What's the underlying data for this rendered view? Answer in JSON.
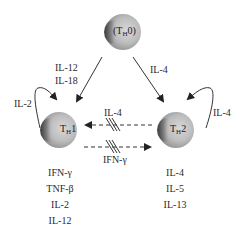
{
  "cells": {
    "th0": {
      "main": "T",
      "sub": "H",
      "suffix": "0"
    },
    "th1": {
      "main": "T",
      "sub": "H",
      "suffix": "1"
    },
    "th2": {
      "main": "T",
      "sub": "H",
      "suffix": "2"
    }
  },
  "arrows": {
    "th0_to_th1": {
      "line1": "IL-12",
      "line2": "IL-18"
    },
    "th0_to_th2": {
      "label": "IL-4"
    },
    "th1_self": {
      "label": "IL-2"
    },
    "th2_self": {
      "label": "IL-4"
    },
    "th2_to_th1_inhibit": {
      "label": "IL-4"
    },
    "th1_to_th2_inhibit": {
      "label": "IFN-γ"
    }
  },
  "th1_products": [
    "IFN-γ",
    "TNF-β",
    "IL-2",
    "IL-12"
  ],
  "th2_products": [
    "IL-4",
    "IL-5",
    "IL-13"
  ],
  "colors": {
    "cell_light": "#cfcfcf",
    "cell_dark": "#3a3a3a",
    "line": "#333333"
  }
}
